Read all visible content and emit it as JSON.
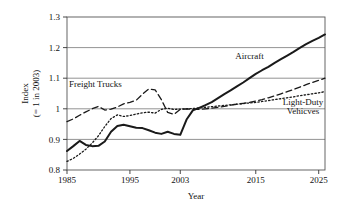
{
  "chart_data": {
    "type": "line",
    "title": "",
    "xlabel": "Year",
    "ylabel_line1": "Index",
    "ylabel_line2": "(= 1 in 2003)",
    "xlim": [
      1985,
      2026
    ],
    "ylim": [
      0.8,
      1.3
    ],
    "grid": true,
    "grid_axis": "y",
    "legend_position": "inline-annotations",
    "xticks": [
      1985,
      1995,
      2003,
      2015,
      2025
    ],
    "xtick_labels": [
      "1985",
      "1995",
      "2003",
      "2015",
      "2025"
    ],
    "yticks": [
      0.8,
      0.9,
      1.0,
      1.1,
      1.2,
      1.3
    ],
    "ytick_labels": [
      "0.8",
      "0.9",
      "1",
      "1.1",
      "1.2",
      "1.3"
    ],
    "annotations": [
      {
        "text": "Freight Trucks",
        "x": 1989.5,
        "y": 1.072
      },
      {
        "text": "Aircraft",
        "x": 2014.0,
        "y": 1.163
      },
      {
        "text": "Light-Duty",
        "x": 2022.5,
        "y": 1.012
      },
      {
        "text": "Vehicves",
        "x": 2022.5,
        "y": 0.982
      }
    ],
    "series": [
      {
        "name": "Aircraft",
        "style": "solid",
        "color": "#1a1a1a",
        "width": 2.0,
        "x": [
          1985,
          1986,
          1987,
          1988,
          1989,
          1990,
          1991,
          1992,
          1993,
          1994,
          1995,
          1996,
          1997,
          1998,
          1999,
          2000,
          2001,
          2002,
          2003,
          2004,
          2005,
          2006,
          2007,
          2008,
          2009,
          2010,
          2011,
          2012,
          2013,
          2014,
          2015,
          2016,
          2017,
          2018,
          2019,
          2020,
          2021,
          2022,
          2023,
          2024,
          2025,
          2026
        ],
        "values": [
          0.862,
          0.878,
          0.895,
          0.882,
          0.878,
          0.879,
          0.893,
          0.925,
          0.944,
          0.948,
          0.943,
          0.938,
          0.937,
          0.93,
          0.922,
          0.918,
          0.925,
          0.918,
          0.915,
          0.965,
          0.995,
          1.003,
          1.012,
          1.022,
          1.035,
          1.048,
          1.06,
          1.073,
          1.086,
          1.1,
          1.114,
          1.126,
          1.137,
          1.15,
          1.162,
          1.174,
          1.186,
          1.199,
          1.211,
          1.222,
          1.232,
          1.243
        ]
      },
      {
        "name": "Freight Trucks",
        "style": "dashed",
        "color": "#1a1a1a",
        "width": 1.3,
        "x": [
          1985,
          1986,
          1987,
          1988,
          1989,
          1990,
          1991,
          1992,
          1993,
          1994,
          1995,
          1996,
          1997,
          1998,
          1999,
          2000,
          2001,
          2002,
          2003,
          2004,
          2005,
          2006,
          2007,
          2008,
          2009,
          2010,
          2011,
          2012,
          2013,
          2014,
          2015,
          2016,
          2017,
          2018,
          2019,
          2020,
          2021,
          2022,
          2023,
          2024,
          2025,
          2026
        ],
        "values": [
          0.958,
          0.967,
          0.979,
          0.99,
          1.0,
          1.008,
          0.996,
          0.999,
          1.006,
          1.016,
          1.021,
          1.028,
          1.048,
          1.065,
          1.062,
          1.03,
          0.988,
          0.982,
          0.998,
          1.0,
          0.998,
          0.998,
          1.0,
          1.002,
          1.005,
          1.008,
          1.012,
          1.015,
          1.018,
          1.021,
          1.025,
          1.03,
          1.036,
          1.042,
          1.049,
          1.056,
          1.063,
          1.071,
          1.079,
          1.086,
          1.093,
          1.1
        ]
      },
      {
        "name": "Light-Duty Vehicves",
        "style": "dotted",
        "color": "#1a1a1a",
        "width": 1.3,
        "x": [
          1985,
          1986,
          1987,
          1988,
          1989,
          1990,
          1991,
          1992,
          1993,
          1994,
          1995,
          1996,
          1997,
          1998,
          1999,
          2000,
          2001,
          2002,
          2003,
          2004,
          2005,
          2006,
          2007,
          2008,
          2009,
          2010,
          2011,
          2012,
          2013,
          2014,
          2015,
          2016,
          2017,
          2018,
          2019,
          2020,
          2021,
          2022,
          2023,
          2024,
          2025,
          2026
        ],
        "values": [
          0.828,
          0.838,
          0.852,
          0.868,
          0.888,
          0.912,
          0.942,
          0.968,
          0.98,
          0.975,
          0.978,
          0.983,
          0.987,
          0.989,
          0.986,
          0.998,
          1.002,
          0.998,
          0.999,
          1.0,
          1.001,
          1.003,
          1.005,
          1.007,
          1.009,
          1.011,
          1.013,
          1.015,
          1.017,
          1.019,
          1.021,
          1.024,
          1.027,
          1.03,
          1.033,
          1.036,
          1.039,
          1.043,
          1.046,
          1.049,
          1.052,
          1.056
        ]
      }
    ]
  }
}
